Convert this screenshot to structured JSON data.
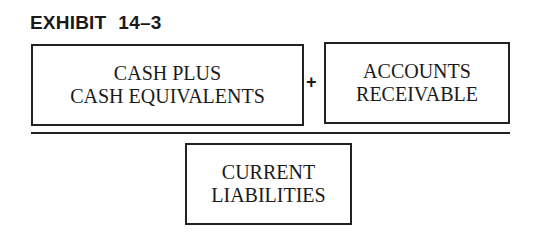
{
  "exhibit": {
    "label": "EXHIBIT",
    "number": "14–3"
  },
  "numerator": {
    "terms": [
      {
        "lines": [
          "CASH PLUS",
          "CASH EQUIVALENTS"
        ]
      },
      {
        "lines": [
          "ACCOUNTS",
          "RECEIVABLE"
        ]
      }
    ],
    "operator": "+"
  },
  "denominator": {
    "lines": [
      "CURRENT",
      "LIABILITIES"
    ]
  }
}
